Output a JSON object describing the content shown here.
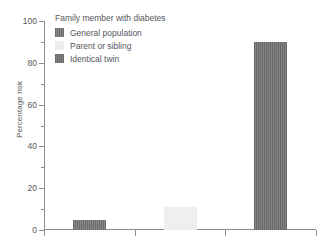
{
  "chart_data": {
    "type": "bar",
    "title": "",
    "subtitle": "",
    "xlabel": "",
    "ylabel": "Percentage risk",
    "ylim": [
      0,
      100
    ],
    "xtick_labels": [
      "",
      "",
      ""
    ],
    "grid": false,
    "legend_position": "top-left",
    "legend_title": "Family member with diabetes",
    "categories": [
      "General population",
      "Parent or sibling",
      "Identical twin"
    ],
    "values": [
      5,
      11,
      90
    ],
    "series": [
      {
        "name": "Percentage risk",
        "values": [
          5,
          11,
          90
        ]
      }
    ],
    "bar_colors": [
      "#6d6d6d",
      "#ededed",
      "#686868"
    ],
    "y_ticks_major": [
      0,
      20,
      40,
      60,
      80,
      100
    ],
    "y_ticks_minor": [
      10,
      30,
      50,
      70,
      90
    ],
    "y_tick_labels": [
      "0",
      "20",
      "40",
      "60",
      "80",
      "100"
    ],
    "annotations": []
  },
  "legend": {
    "title": "Family member with diabetes",
    "items": [
      {
        "label": "General population",
        "color": "#6d6d6d"
      },
      {
        "label": "Parent or sibling",
        "color": "#ededed"
      },
      {
        "label": "Identical twin",
        "color": "#686868"
      }
    ]
  },
  "axes": {
    "y_label": "Percentage risk",
    "axis_color": "#8d8d8d",
    "background": "#ffffff"
  }
}
